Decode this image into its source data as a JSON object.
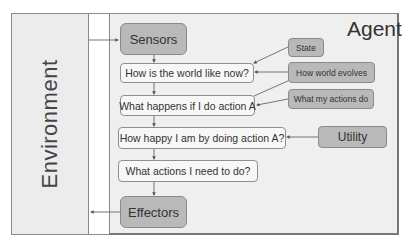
{
  "diagram": {
    "environment": {
      "label": "Environment"
    },
    "agent": {
      "title": "Agent"
    },
    "nodes": {
      "sensors": "Sensors",
      "world_now": "How is the world like now?",
      "what_happens": "What happens if I do action A",
      "how_happy": "How happy I am by doing action A?",
      "what_actions": "What actions I need to do?",
      "effectors": "Effectors",
      "state": "State",
      "world_evolves": "How world evolves",
      "my_actions_do": "What my actions do",
      "utility": "Utility"
    },
    "edges": [
      [
        "environment",
        "sensors"
      ],
      [
        "sensors",
        "world_now"
      ],
      [
        "state",
        "world_now"
      ],
      [
        "world_evolves",
        "world_now"
      ],
      [
        "world_evolves",
        "what_happens"
      ],
      [
        "world_now",
        "what_happens"
      ],
      [
        "my_actions_do",
        "what_happens"
      ],
      [
        "what_happens",
        "how_happy"
      ],
      [
        "utility",
        "how_happy"
      ],
      [
        "how_happy",
        "what_actions"
      ],
      [
        "what_actions",
        "effectors"
      ],
      [
        "effectors",
        "environment"
      ]
    ],
    "colors": {
      "dark_box": "#b9b9b9",
      "light_box": "#f7f7f7",
      "panel": "#efefef",
      "environment_panel": "#ececec",
      "line": "#666666"
    }
  }
}
